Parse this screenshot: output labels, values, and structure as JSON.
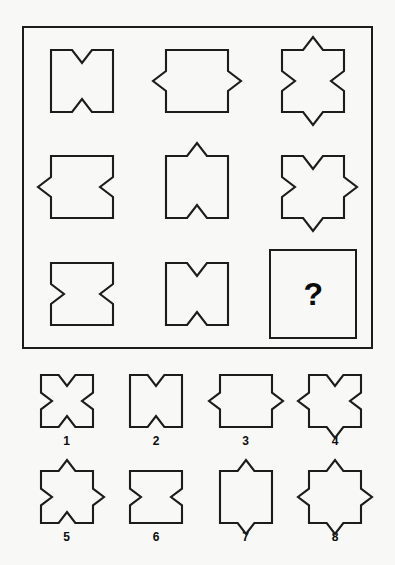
{
  "puzzle": {
    "type": "visual-analogy-matrix",
    "question_mark": "?",
    "matrix": {
      "rows": 3,
      "columns": 3,
      "cells": [
        {
          "id": "cell-1-1",
          "name": "matrix-cell-r1c1",
          "top": "in",
          "bottom": "in",
          "left": "none",
          "right": "none"
        },
        {
          "id": "cell-1-2",
          "name": "matrix-cell-r1c2",
          "top": "none",
          "bottom": "none",
          "left": "out",
          "right": "out"
        },
        {
          "id": "cell-1-3",
          "name": "matrix-cell-r1c3",
          "top": "out",
          "bottom": "out",
          "left": "in",
          "right": "in"
        },
        {
          "id": "cell-2-1",
          "name": "matrix-cell-r2c1",
          "top": "none",
          "bottom": "none",
          "left": "out",
          "right": "in"
        },
        {
          "id": "cell-2-2",
          "name": "matrix-cell-r2c2",
          "top": "out",
          "bottom": "in",
          "left": "none",
          "right": "none"
        },
        {
          "id": "cell-2-3",
          "name": "matrix-cell-r2c3",
          "top": "in",
          "bottom": "out",
          "left": "in",
          "right": "out"
        },
        {
          "id": "cell-3-1",
          "name": "matrix-cell-r3c1",
          "top": "none",
          "bottom": "none",
          "left": "in",
          "right": "in"
        },
        {
          "id": "cell-3-2",
          "name": "matrix-cell-r3c2",
          "top": "in",
          "bottom": "in",
          "left": "none",
          "right": "none"
        },
        {
          "id": "cell-3-3",
          "name": "matrix-cell-answer",
          "is_question": true
        }
      ]
    },
    "options": [
      {
        "label": "1",
        "name": "option-1",
        "top": "in",
        "bottom": "in",
        "left": "in",
        "right": "in"
      },
      {
        "label": "2",
        "name": "option-2",
        "top": "in",
        "bottom": "in",
        "left": "none",
        "right": "none"
      },
      {
        "label": "3",
        "name": "option-3",
        "top": "none",
        "bottom": "none",
        "left": "out",
        "right": "out"
      },
      {
        "label": "4",
        "name": "option-4",
        "top": "in",
        "bottom": "out",
        "left": "out",
        "right": "in"
      },
      {
        "label": "5",
        "name": "option-5",
        "top": "out",
        "bottom": "in",
        "left": "in",
        "right": "out"
      },
      {
        "label": "6",
        "name": "option-6",
        "top": "none",
        "bottom": "none",
        "left": "in",
        "right": "in"
      },
      {
        "label": "7",
        "name": "option-7",
        "top": "out",
        "bottom": "out",
        "left": "none",
        "right": "none"
      },
      {
        "label": "8",
        "name": "option-8",
        "top": "out",
        "bottom": "out",
        "left": "out",
        "right": "out"
      }
    ]
  },
  "colors": {
    "background": "#f8f8f6",
    "stroke": "#1c1c1c",
    "text": "#0a0a0a"
  }
}
